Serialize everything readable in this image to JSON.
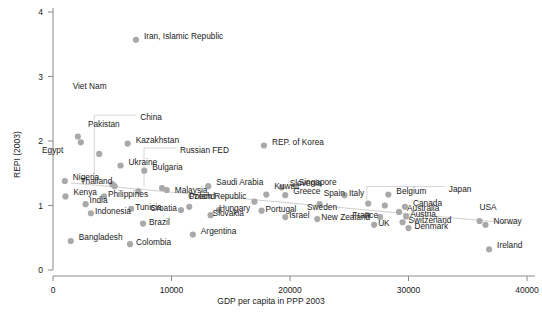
{
  "chart_data": {
    "type": "scatter",
    "title": "",
    "xlabel": "GDP per capita in PPP 2003",
    "ylabel": "REPI (2003)",
    "xlim": [
      0,
      40000
    ],
    "ylim": [
      0,
      4
    ],
    "xticks": [
      "0",
      "10000",
      "20000",
      "30000",
      "40000"
    ],
    "xtick_values": [
      0,
      10000,
      20000,
      30000,
      40000
    ],
    "yticks": [
      "0",
      "1",
      "2",
      "3",
      "4"
    ],
    "ytick_values": [
      0,
      1,
      2,
      3,
      4
    ],
    "grid": false,
    "legend": "none",
    "marker_color": "#a9a9a9",
    "trendline": {
      "present": true,
      "color": "#cfcfcf",
      "x0": 1500,
      "y0": 1.35,
      "x1": 39000,
      "y1": 0.72
    },
    "points": [
      {
        "name": "Iran, Islamic Republic",
        "x": 7000,
        "y": 3.57,
        "lx": 8,
        "ly": -4
      },
      {
        "name": "Viet Nam",
        "x": 5200,
        "y": 1.3,
        "lx": -8,
        "ly": -100,
        "leader": "none"
      },
      {
        "name": "China",
        "x": 5000,
        "y": 1.33,
        "lx": 28,
        "ly": -67,
        "leader": "elbow-left-down"
      },
      {
        "name": "Pakistan",
        "x": 2100,
        "y": 2.07,
        "lx": 10,
        "ly": -12
      },
      {
        "name": "Pakistan-b",
        "x": 2350,
        "y": 1.98,
        "lx": 0,
        "ly": 0,
        "nolabel": true
      },
      {
        "name": "Kazakhstan",
        "x": 6300,
        "y": 1.96,
        "lx": 8,
        "ly": -4
      },
      {
        "name": "REP. of Korea",
        "x": 17800,
        "y": 1.93,
        "lx": 8,
        "ly": -4
      },
      {
        "name": "Egypt",
        "x": 3900,
        "y": 1.8,
        "lx": -36,
        "ly": -4
      },
      {
        "name": "Ukraine",
        "x": 5700,
        "y": 1.62,
        "lx": 8,
        "ly": -4
      },
      {
        "name": "Bulgaria",
        "x": 7700,
        "y": 1.54,
        "lx": 8,
        "ly": -4
      },
      {
        "name": "Russian FED",
        "x": 9200,
        "y": 1.27,
        "lx": 18,
        "ly": -38,
        "leader": "elbow-left-down"
      },
      {
        "name": "Nigeria",
        "x": 1000,
        "y": 1.38,
        "lx": 8,
        "ly": -4
      },
      {
        "name": "Saudi Arabia",
        "x": 13100,
        "y": 1.3,
        "lx": 8,
        "ly": -4
      },
      {
        "name": "Malaysia",
        "x": 9600,
        "y": 1.24,
        "lx": 8,
        "ly": 0
      },
      {
        "name": "Slovenia",
        "x": 19300,
        "y": 1.28,
        "lx": 8,
        "ly": -4
      },
      {
        "name": "Kuwait",
        "x": 18000,
        "y": 1.17,
        "lx": 8,
        "ly": -9
      },
      {
        "name": "Greece",
        "x": 19600,
        "y": 1.16,
        "lx": 8,
        "ly": -4
      },
      {
        "name": "Singapore",
        "x": 24600,
        "y": 1.16,
        "lx": -8,
        "ly": -13
      },
      {
        "name": "Belgium",
        "x": 28300,
        "y": 1.17,
        "lx": 8,
        "ly": -4
      },
      {
        "name": "Thailand",
        "x": 7200,
        "y": 1.22,
        "lx": -26,
        "ly": -10
      },
      {
        "name": "Kenya",
        "x": 1050,
        "y": 1.14,
        "lx": 8,
        "ly": -4
      },
      {
        "name": "Philippines",
        "x": 4300,
        "y": 1.14,
        "lx": 4,
        "ly": -2
      },
      {
        "name": "India",
        "x": 2750,
        "y": 1.02,
        "lx": 4,
        "ly": -4
      },
      {
        "name": "Czech Republic",
        "x": 17000,
        "y": 1.06,
        "lx": -8,
        "ly": -6
      },
      {
        "name": "Spain",
        "x": 22500,
        "y": 1.02,
        "lx": 4,
        "ly": -11
      },
      {
        "name": "Italy",
        "x": 26600,
        "y": 1.03,
        "lx": -4,
        "ly": -11
      },
      {
        "name": "Japan",
        "x": 28000,
        "y": 1.0,
        "lx": 64,
        "ly": -17,
        "leader": "elbow-left-down"
      },
      {
        "name": "Canada",
        "x": 29700,
        "y": 0.98,
        "lx": 8,
        "ly": -4
      },
      {
        "name": "Poland",
        "x": 11500,
        "y": 0.98,
        "lx": 0,
        "ly": -11
      },
      {
        "name": "Croatia",
        "x": 10800,
        "y": 0.93,
        "lx": -4,
        "ly": -2
      },
      {
        "name": "Hungary",
        "x": 14000,
        "y": 0.93,
        "lx": 0,
        "ly": -2
      },
      {
        "name": "Portugal",
        "x": 17600,
        "y": 0.92,
        "lx": 4,
        "ly": -2
      },
      {
        "name": "Australia",
        "x": 29200,
        "y": 0.9,
        "lx": 8,
        "ly": -4
      },
      {
        "name": "Austria",
        "x": 29800,
        "y": 0.83,
        "lx": 4,
        "ly": -2
      },
      {
        "name": "Sweden",
        "x": 26500,
        "y": 0.85,
        "lx": -30,
        "ly": -8
      },
      {
        "name": "France",
        "x": 27600,
        "y": 0.82,
        "lx": -2,
        "ly": -2
      },
      {
        "name": "Indonesia",
        "x": 3200,
        "y": 0.88,
        "lx": 4,
        "ly": -2
      },
      {
        "name": "Tunisia",
        "x": 6600,
        "y": 0.95,
        "lx": 4,
        "ly": -2
      },
      {
        "name": "Slovakia",
        "x": 13300,
        "y": 0.85,
        "lx": 2,
        "ly": -2
      },
      {
        "name": "Israel",
        "x": 19600,
        "y": 0.82,
        "lx": 4,
        "ly": -2
      },
      {
        "name": "New Zealand",
        "x": 22300,
        "y": 0.79,
        "lx": 4,
        "ly": -2
      },
      {
        "name": "Switzerland",
        "x": 29500,
        "y": 0.74,
        "lx": 6,
        "ly": -2
      },
      {
        "name": "UK",
        "x": 27100,
        "y": 0.7,
        "lx": 4,
        "ly": -2
      },
      {
        "name": "Denmark",
        "x": 30000,
        "y": 0.65,
        "lx": 6,
        "ly": -2
      },
      {
        "name": "USA",
        "x": 36000,
        "y": 0.76,
        "lx": 0,
        "ly": -14,
        "leader": "none"
      },
      {
        "name": "Norway",
        "x": 36500,
        "y": 0.7,
        "lx": 8,
        "ly": -4
      },
      {
        "name": "Ireland",
        "x": 36800,
        "y": 0.32,
        "lx": 8,
        "ly": -4
      },
      {
        "name": "Brazil",
        "x": 7600,
        "y": 0.72,
        "lx": 6,
        "ly": -2
      },
      {
        "name": "Argentina",
        "x": 11800,
        "y": 0.55,
        "lx": 8,
        "ly": -4
      },
      {
        "name": "Bangladesh",
        "x": 1500,
        "y": 0.45,
        "lx": 8,
        "ly": -4
      },
      {
        "name": "Colombia",
        "x": 6500,
        "y": 0.4,
        "lx": 6,
        "ly": -2
      }
    ]
  }
}
